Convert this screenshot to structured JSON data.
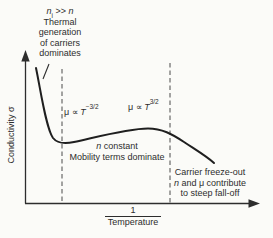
{
  "figure": {
    "background": "#fbfbf8",
    "ink": "#2d2d2d"
  },
  "axes": {
    "y_label": "Conductivity σ",
    "x_numerator": "1",
    "x_denominator": "Temperature"
  },
  "annotations": {
    "thermal": {
      "f_n1": "n",
      "f_sub": "i",
      "f_rel": " >> ",
      "f_n2": "n",
      "line1": "Thermal",
      "line2": "generation",
      "line3": "of carriers",
      "line4": "dominates"
    },
    "mobility_left": {
      "prefix": "μ ∝ ",
      "t": "T",
      "exp": "−3/2"
    },
    "mobility_right": {
      "prefix": "μ ∝ ",
      "t": "T",
      "exp": "3/2"
    },
    "constant_region": {
      "n": "n",
      "rest": " constant",
      "line2": "Mobility terms dominate"
    },
    "freeze_out": {
      "line1": "Carrier freeze-out",
      "n": "n",
      "rest": " and μ contribute",
      "line3": "to steep fall-off"
    }
  }
}
